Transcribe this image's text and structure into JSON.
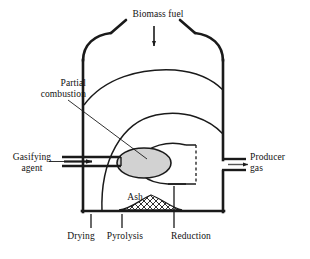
{
  "figure": {
    "colors": {
      "stroke": "#1a1a1a",
      "combustion_fill": "#d2d2d2",
      "ash_fill": "#ffffff",
      "background": "#ffffff"
    }
  },
  "labels": {
    "biomass_fuel": "Biomass fuel",
    "partial_combustion": "Partial\ncombustion",
    "gasifying_agent": "Gasifying\nagent",
    "producer_gas": "Producer\ngas",
    "ash": "Ash",
    "drying": "Drying",
    "pyrolysis": "Pyrolysis",
    "reduction": "Reduction"
  },
  "icons": {
    "feed_arrow": "down-arrow-icon",
    "inlet_arrow": "right-arrow-icon",
    "outlet_arrow": "right-arrow-icon"
  },
  "zones": [
    {
      "name": "Drying",
      "order": 1
    },
    {
      "name": "Pyrolysis",
      "order": 2
    },
    {
      "name": "Partial combustion",
      "order": 3
    },
    {
      "name": "Reduction",
      "order": 4
    }
  ],
  "streams": [
    {
      "name": "Biomass fuel",
      "direction": "in",
      "position": "top"
    },
    {
      "name": "Gasifying agent",
      "direction": "in",
      "position": "left"
    },
    {
      "name": "Producer gas",
      "direction": "out",
      "position": "right"
    },
    {
      "name": "Ash",
      "direction": "residue",
      "position": "bottom"
    }
  ]
}
